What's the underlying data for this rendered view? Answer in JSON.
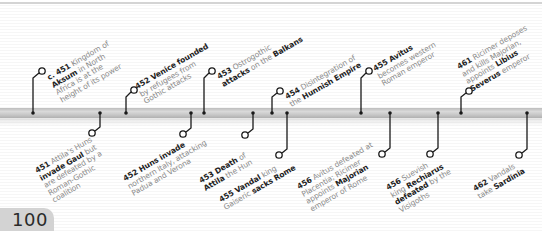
{
  "page": {
    "number": "100"
  },
  "timeline": {
    "bar_color": "#c8c8c8",
    "pin_color": "#1a1a1a",
    "events_above": [
      {
        "id": "e1",
        "year": "c. 451",
        "lines": [
          [
            {
              "t": "c. 451",
              "b": true
            },
            {
              "t": " Kingdom of",
              "b": false
            }
          ],
          [
            {
              "t": "Aksum",
              "b": true
            },
            {
              "t": " in North",
              "b": false
            }
          ],
          [
            {
              "t": "Africa is at the",
              "b": false
            }
          ],
          [
            {
              "t": "height of its power",
              "b": false
            }
          ]
        ]
      },
      {
        "id": "e2",
        "year": "452",
        "lines": [
          [
            {
              "t": "452 Venice founded",
              "b": true
            }
          ],
          [
            {
              "t": "by refugees from",
              "b": false
            }
          ],
          [
            {
              "t": "Gothic attacks",
              "b": false
            }
          ]
        ]
      },
      {
        "id": "e3",
        "year": "453",
        "lines": [
          [
            {
              "t": "453",
              "b": true
            },
            {
              "t": " Ostrogothic",
              "b": false
            }
          ],
          [
            {
              "t": "attacks",
              "b": true
            },
            {
              "t": " on the ",
              "b": false
            },
            {
              "t": "Balkans",
              "b": true
            }
          ]
        ]
      },
      {
        "id": "e4",
        "year": "454",
        "lines": [
          [
            {
              "t": "454",
              "b": true
            },
            {
              "t": " Disintegration of",
              "b": false
            }
          ],
          [
            {
              "t": "the ",
              "b": false
            },
            {
              "t": "Hunnish Empire",
              "b": true
            }
          ]
        ]
      },
      {
        "id": "e5",
        "year": "455",
        "lines": [
          [
            {
              "t": "455 Avitus",
              "b": true
            }
          ],
          [
            {
              "t": "becomes western",
              "b": false
            }
          ],
          [
            {
              "t": "Roman emperor",
              "b": false
            }
          ]
        ]
      },
      {
        "id": "e6",
        "year": "461",
        "lines": [
          [
            {
              "t": "461",
              "b": true
            },
            {
              "t": " Ricimer deposes",
              "b": false
            }
          ],
          [
            {
              "t": "and kills Majorian,",
              "b": false
            }
          ],
          [
            {
              "t": "appoints ",
              "b": false
            },
            {
              "t": "Libius",
              "b": true
            }
          ],
          [
            {
              "t": "Severus",
              "b": true
            },
            {
              "t": " emperor",
              "b": false
            }
          ]
        ]
      }
    ],
    "events_below": [
      {
        "id": "e7",
        "year": "451",
        "lines": [
          [
            {
              "t": "451",
              "b": true
            },
            {
              "t": " Attila's Huns",
              "b": false
            }
          ],
          [
            {
              "t": "invade Gaul",
              "b": true
            },
            {
              "t": " but",
              "b": false
            }
          ],
          [
            {
              "t": "are defeated by a",
              "b": false
            }
          ],
          [
            {
              "t": "Roman-Gothic",
              "b": false
            }
          ],
          [
            {
              "t": "coalition",
              "b": false
            }
          ]
        ]
      },
      {
        "id": "e8",
        "year": "452",
        "lines": [
          [
            {
              "t": "452 Huns invade",
              "b": true
            }
          ],
          [
            {
              "t": "northern Italy, attacking",
              "b": false
            }
          ],
          [
            {
              "t": "Padua and Verona",
              "b": false
            }
          ]
        ]
      },
      {
        "id": "e9",
        "year": "453",
        "lines": [
          [
            {
              "t": "453 Death",
              "b": true
            },
            {
              "t": " of",
              "b": false
            }
          ],
          [
            {
              "t": "Attila",
              "b": true
            },
            {
              "t": " the Hun",
              "b": false
            }
          ]
        ]
      },
      {
        "id": "e10",
        "year": "455",
        "lines": [
          [
            {
              "t": "455 Vandal",
              "b": true
            },
            {
              "t": " king",
              "b": false
            }
          ],
          [
            {
              "t": "Gaiseric ",
              "b": false
            },
            {
              "t": "sacks Rome",
              "b": true
            }
          ]
        ]
      },
      {
        "id": "e11",
        "year": "456",
        "lines": [
          [
            {
              "t": "456",
              "b": true
            },
            {
              "t": " Avitus defeated at",
              "b": false
            }
          ],
          [
            {
              "t": "Placentia; Ricimer",
              "b": false
            }
          ],
          [
            {
              "t": "appoints ",
              "b": false
            },
            {
              "t": "Majorian",
              "b": true
            }
          ],
          [
            {
              "t": "emperor of Rome",
              "b": false
            }
          ]
        ]
      },
      {
        "id": "e12",
        "year": "456",
        "lines": [
          [
            {
              "t": "456",
              "b": true
            },
            {
              "t": " Suevish",
              "b": false
            }
          ],
          [
            {
              "t": "king ",
              "b": false
            },
            {
              "t": "Rechiarus",
              "b": true
            }
          ],
          [
            {
              "t": "defeated",
              "b": true
            },
            {
              "t": " by the",
              "b": false
            }
          ],
          [
            {
              "t": "Visigoths",
              "b": false
            }
          ]
        ]
      },
      {
        "id": "e13",
        "year": "462",
        "lines": [
          [
            {
              "t": "462",
              "b": true
            },
            {
              "t": " Vandals",
              "b": false
            }
          ],
          [
            {
              "t": "take ",
              "b": false
            },
            {
              "t": "Sardinia",
              "b": true
            }
          ]
        ]
      }
    ]
  }
}
